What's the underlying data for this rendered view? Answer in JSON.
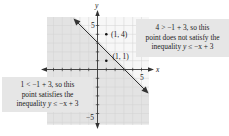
{
  "graph": {
    "x_axis_label": "x",
    "y_axis_label": "y",
    "x_tick_label_pos": "5",
    "y_tick_label_pos": "5",
    "y_tick_label_neg": "−5",
    "x_range": [
      -6,
      6
    ],
    "y_range": [
      -6,
      6
    ],
    "boundary_line": "y = −x + 3",
    "boundary_style": "solid",
    "shaded_region": "below line (y ≤ −x + 3)",
    "colors": {
      "shade": "#e3e3e3",
      "grid": "#cfcfcf",
      "axis": "#333333",
      "line": "#333333",
      "callout_bg": "#e6e6e6"
    }
  },
  "points": [
    {
      "label": "(1, 4)",
      "x": 1,
      "y": 4
    },
    {
      "label": "(1, 1)",
      "x": 1,
      "y": 1
    }
  ],
  "callouts": {
    "right": {
      "line1": "4 > −1 + 3, so this",
      "line2": "point does not satisfy the",
      "line3_prefix": "inequality ",
      "line3_var": "y",
      "line3_suffix": " ≤ −x + 3"
    },
    "left": {
      "line1": "1 < −1 + 3, so this",
      "line2": "point satisfies the",
      "line3_prefix": "inequality ",
      "line3_var": "y",
      "line3_suffix": " ≤ −x + 3"
    }
  }
}
